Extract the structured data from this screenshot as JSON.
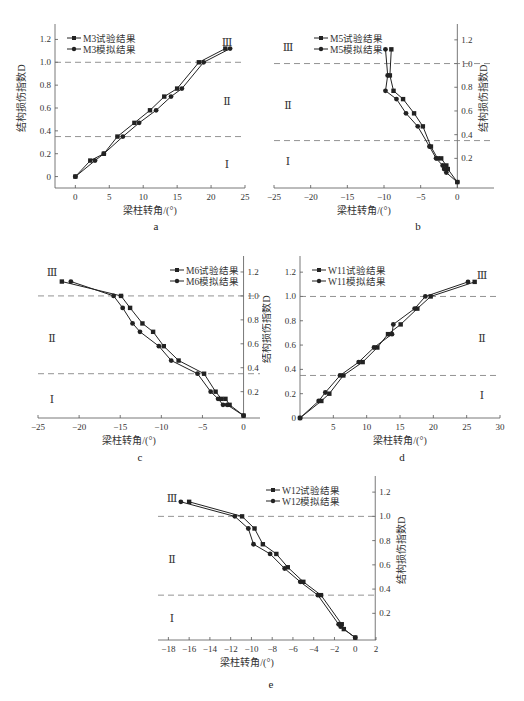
{
  "figure": {
    "panel_labels": [
      "a",
      "b",
      "c",
      "d",
      "e"
    ]
  },
  "chart_data": [
    {
      "id": "a",
      "type": "line",
      "title": "",
      "xlabel": "梁柱转角/(°)",
      "ylabel": "结构损伤指数D",
      "xlim": [
        -3,
        25
      ],
      "ylim": [
        -0.1,
        1.3
      ],
      "xticks": [
        0,
        5,
        10,
        15,
        20,
        25
      ],
      "yticks": [
        0,
        0.2,
        0.4,
        0.6,
        0.8,
        1.0,
        1.2
      ],
      "ytick_labels": [
        "0",
        "0.2",
        "0.4",
        "0.6",
        "0.8",
        "1.0",
        "1.2"
      ],
      "ylabel_side": "left",
      "legend": {
        "position": "top-left",
        "entries": [
          "M3试验结果",
          "M3模拟结果"
        ]
      },
      "thresholds": [
        0.35,
        1.0
      ],
      "region_labels": [
        {
          "text": "Ⅲ",
          "y": 1.18
        },
        {
          "text": "Ⅱ",
          "y": 0.66
        },
        {
          "text": "Ⅰ",
          "y": 0.11
        }
      ],
      "series": [
        {
          "name": "M3试验结果",
          "marker": "square",
          "x": [
            0,
            2.2,
            4.2,
            6.2,
            8.7,
            11.0,
            13.1,
            15.0,
            18.2,
            22.1
          ],
          "y": [
            0,
            0.14,
            0.2,
            0.35,
            0.47,
            0.58,
            0.7,
            0.77,
            1.0,
            1.12
          ]
        },
        {
          "name": "M3模拟结果",
          "marker": "circle",
          "x": [
            0,
            2.9,
            4.2,
            7.0,
            9.4,
            11.9,
            14.1,
            15.7,
            18.9,
            22.8
          ],
          "y": [
            0,
            0.14,
            0.2,
            0.35,
            0.47,
            0.58,
            0.7,
            0.77,
            1.0,
            1.12
          ]
        }
      ]
    },
    {
      "id": "b",
      "type": "line",
      "title": "",
      "xlabel": "梁柱转角/(°)",
      "ylabel": "结构损伤指数D",
      "xlim": [
        -25,
        5
      ],
      "ylim": [
        -0.05,
        1.3
      ],
      "xticks": [
        -25,
        -20,
        -15,
        -10,
        -5,
        0
      ],
      "xtick_labels": [
        "−25",
        "−20",
        "−15",
        "−10",
        "−5",
        "0"
      ],
      "yticks": [
        0.2,
        0.4,
        0.6,
        0.8,
        1.0,
        1.2
      ],
      "ytick_labels": [
        "0.2",
        "0.4",
        "0.6",
        "0.8",
        "1.0",
        "1.2"
      ],
      "ylabel_side": "right",
      "legend": {
        "position": "top-left",
        "entries": [
          "M5试验结果",
          "M5模拟结果"
        ]
      },
      "thresholds": [
        0.35,
        1.0
      ],
      "region_labels": [
        {
          "text": "Ⅲ",
          "y": 1.14
        },
        {
          "text": "Ⅱ",
          "y": 0.65
        },
        {
          "text": "Ⅰ",
          "y": 0.18
        }
      ],
      "series": [
        {
          "name": "M5试验结果",
          "marker": "square",
          "x": [
            0,
            -1.3,
            -1.5,
            -2.2,
            -2.7,
            -3.6,
            -4.7,
            -5.9,
            -7.4,
            -8.7,
            -9.2,
            -9.0
          ],
          "y": [
            0,
            0.11,
            0.14,
            0.2,
            0.2,
            0.3,
            0.47,
            0.58,
            0.7,
            0.77,
            0.9,
            1.12
          ]
        },
        {
          "name": "M5模拟结果",
          "marker": "circle",
          "x": [
            0,
            -1.5,
            -1.8,
            -2.0,
            -2.9,
            -3.8,
            -5.4,
            -7.0,
            -8.3,
            -9.8,
            -9.5,
            -9.8
          ],
          "y": [
            0,
            0.08,
            0.11,
            0.14,
            0.2,
            0.3,
            0.47,
            0.58,
            0.7,
            0.77,
            0.9,
            1.12
          ]
        }
      ]
    },
    {
      "id": "c",
      "type": "line",
      "title": "",
      "xlabel": "梁柱转角/(°)",
      "ylabel": "结构损伤指数D",
      "xlim": [
        -25,
        2
      ],
      "ylim": [
        -0.02,
        1.3
      ],
      "xticks": [
        -25,
        -20,
        -15,
        -10,
        -5,
        0
      ],
      "xtick_labels": [
        "−25",
        "−20",
        "−15",
        "−10",
        "−5",
        "0"
      ],
      "yticks": [
        0.2,
        0.4,
        0.6,
        0.8,
        1.0,
        1.2
      ],
      "ytick_labels": [
        "0.2",
        "0.4",
        "0.6",
        "0.8",
        "1.0",
        "1.2"
      ],
      "ylabel_side": "right",
      "legend": {
        "position": "top-right",
        "entries": [
          "M6试验结果",
          "M6模拟结果"
        ]
      },
      "thresholds": [
        0.35,
        1.0
      ],
      "region_labels": [
        {
          "text": "Ⅲ",
          "y": 1.2
        },
        {
          "text": "Ⅱ",
          "y": 0.65
        },
        {
          "text": "Ⅰ",
          "y": 0.14
        }
      ],
      "series": [
        {
          "name": "M6试验结果",
          "marker": "square",
          "x": [
            0,
            -1.7,
            -2.2,
            -2.7,
            -3.4,
            -4.8,
            -7.9,
            -9.7,
            -11.0,
            -12.3,
            -13.8,
            -14.9,
            -22.1
          ],
          "y": [
            0,
            0.09,
            0.14,
            0.14,
            0.2,
            0.35,
            0.46,
            0.58,
            0.7,
            0.77,
            0.9,
            1.0,
            1.12
          ]
        },
        {
          "name": "M6试验结果 (sim)",
          "display_name": "M6模拟结果",
          "marker": "circle",
          "x": [
            0,
            -2.0,
            -2.5,
            -3.1,
            -4.0,
            -5.6,
            -8.8,
            -10.3,
            -12.6,
            -13.5,
            -14.7,
            -15.8,
            -21.0
          ],
          "y": [
            0,
            0.09,
            0.09,
            0.14,
            0.2,
            0.35,
            0.46,
            0.58,
            0.7,
            0.77,
            0.9,
            1.0,
            1.12
          ]
        }
      ]
    },
    {
      "id": "d",
      "type": "line",
      "title": "",
      "xlabel": "梁柱转角/(°)",
      "ylabel": "结构损伤指数D",
      "xlim": [
        0,
        30
      ],
      "ylim": [
        0,
        1.3
      ],
      "xticks": [
        5,
        10,
        15,
        20,
        25,
        30
      ],
      "yticks": [
        0,
        0.2,
        0.4,
        0.6,
        0.8,
        1.0,
        1.2
      ],
      "ytick_labels": [
        "0",
        "0.2",
        "0.4",
        "0.6",
        "0.8",
        "1.0",
        "1.2"
      ],
      "ylabel_side": "left",
      "legend": {
        "position": "top-left",
        "entries": [
          "W11试验结果",
          "W11模拟结果"
        ]
      },
      "thresholds": [
        0.35,
        1.0
      ],
      "region_labels": [
        {
          "text": "Ⅲ",
          "y": 1.18
        },
        {
          "text": "Ⅱ",
          "y": 0.66
        },
        {
          "text": "Ⅰ",
          "y": 0.19
        }
      ],
      "series": [
        {
          "name": "W11试验结果",
          "marker": "square",
          "x": [
            0,
            3.2,
            4.4,
            6.5,
            9.4,
            11.6,
            13.2,
            15.1,
            17.6,
            19.6,
            26.2
          ],
          "y": [
            0,
            0.14,
            0.2,
            0.35,
            0.46,
            0.58,
            0.69,
            0.77,
            0.9,
            1.0,
            1.12
          ]
        },
        {
          "name": "W11模拟结果",
          "marker": "circle",
          "x": [
            0,
            2.8,
            3.8,
            6.0,
            8.8,
            11.1,
            13.8,
            14.0,
            17.2,
            18.8,
            25.2
          ],
          "y": [
            0,
            0.14,
            0.21,
            0.35,
            0.46,
            0.58,
            0.69,
            0.77,
            0.9,
            1.0,
            1.12
          ]
        }
      ]
    },
    {
      "id": "e",
      "type": "line",
      "title": "",
      "xlabel": "梁柱转角/(°)",
      "ylabel": "结构损伤指数D",
      "xlim": [
        -19,
        2
      ],
      "ylim": [
        -0.02,
        1.3
      ],
      "xticks": [
        -18,
        -16,
        -14,
        -12,
        -10,
        -8,
        -6,
        -4,
        -2,
        0,
        2
      ],
      "xtick_labels": [
        "−18",
        "−16",
        "−14",
        "−12",
        "−10",
        "−8",
        "−6",
        "−4",
        "−2",
        "0",
        "2"
      ],
      "yticks": [
        0.2,
        0.4,
        0.6,
        0.8,
        1.0,
        1.2
      ],
      "ytick_labels": [
        "0.2",
        "0.4",
        "0.6",
        "0.8",
        "1.0",
        "1.2"
      ],
      "ylabel_side": "right",
      "legend": {
        "position": "top-right",
        "entries": [
          "W12试验结果",
          "W12模拟结果"
        ]
      },
      "thresholds": [
        0.35,
        1.0
      ],
      "region_labels": [
        {
          "text": "Ⅲ",
          "y": 1.15
        },
        {
          "text": "Ⅱ",
          "y": 0.65
        },
        {
          "text": "Ⅰ",
          "y": 0.16
        }
      ],
      "series": [
        {
          "name": "W12试验结果",
          "marker": "square",
          "x": [
            0,
            -1.1,
            -1.3,
            -3.3,
            -5.0,
            -6.5,
            -7.6,
            -8.9,
            -9.7,
            -10.9,
            -16.0
          ],
          "y": [
            0,
            0.07,
            0.11,
            0.35,
            0.46,
            0.58,
            0.69,
            0.77,
            0.9,
            1.0,
            1.12
          ]
        },
        {
          "name": "W12模拟结果",
          "marker": "circle",
          "x": [
            0,
            -1.4,
            -1.6,
            -3.6,
            -5.3,
            -6.8,
            -8.2,
            -9.8,
            -10.3,
            -11.6,
            -16.8
          ],
          "y": [
            0,
            0.09,
            0.11,
            0.35,
            0.46,
            0.57,
            0.69,
            0.77,
            0.9,
            1.0,
            1.12
          ]
        }
      ]
    }
  ]
}
